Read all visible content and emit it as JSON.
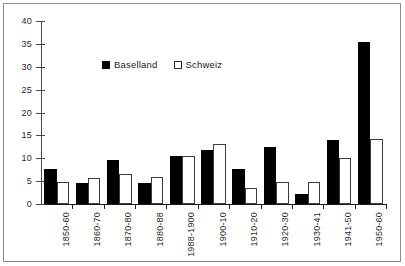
{
  "chart_data": {
    "type": "bar",
    "title": "",
    "xlabel": "",
    "ylabel": "",
    "ylim": [
      0,
      40
    ],
    "yticks": [
      0,
      5,
      10,
      15,
      20,
      25,
      30,
      35,
      40
    ],
    "grid": false,
    "legend_position": "top-center",
    "categories": [
      "1850-60",
      "1860-70",
      "1870-80",
      "1880-88",
      "1988-1900",
      "1900-10",
      "1910-20",
      "1920-30",
      "1930-41",
      "1941-50",
      "1950-60"
    ],
    "series": [
      {
        "name": "Baselland",
        "color": "#000000",
        "values": [
          7.6,
          4.7,
          9.6,
          4.7,
          10.6,
          11.8,
          7.7,
          12.4,
          2.2,
          14.0,
          35.5
        ]
      },
      {
        "name": "Schweiz",
        "color": "#ffffff",
        "values": [
          4.9,
          5.7,
          6.6,
          6.0,
          10.4,
          13.2,
          3.4,
          4.9,
          4.9,
          10.0,
          14.3
        ]
      }
    ]
  },
  "legend": {
    "items": [
      {
        "label": "Baselland",
        "swatch": "filled-square"
      },
      {
        "label": "Schweiz",
        "swatch": "outlined-square"
      }
    ]
  },
  "axis": {
    "y_tick_labels": [
      "0",
      "5",
      "10",
      "15",
      "20",
      "25",
      "30",
      "35",
      "40"
    ]
  }
}
